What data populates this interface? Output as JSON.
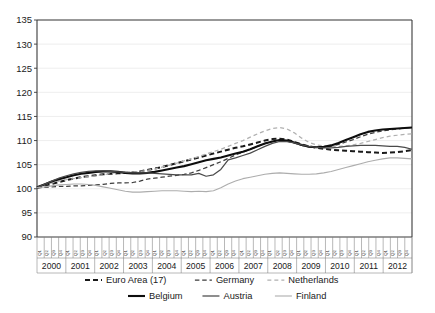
{
  "chart_data": {
    "type": "line",
    "title": "",
    "xlabel": "",
    "ylabel": "",
    "ylim": [
      90,
      135
    ],
    "ytick_step": 5,
    "yticks": [
      "90",
      "95",
      "100",
      "105",
      "110",
      "115",
      "120",
      "125",
      "130",
      "135"
    ],
    "grid": true,
    "legend_position": "bottom",
    "x_years": [
      "2000",
      "2001",
      "2002",
      "2003",
      "2004",
      "2005",
      "2006",
      "2007",
      "2008",
      "2009",
      "2010",
      "2011",
      "2012"
    ],
    "x_quarters": [
      "Q1",
      "Q2",
      "Q3",
      "Q4"
    ],
    "x": [
      "2000Q1",
      "2000Q2",
      "2000Q3",
      "2000Q4",
      "2001Q1",
      "2001Q2",
      "2001Q3",
      "2001Q4",
      "2002Q1",
      "2002Q2",
      "2002Q3",
      "2002Q4",
      "2003Q1",
      "2003Q2",
      "2003Q3",
      "2003Q4",
      "2004Q1",
      "2004Q2",
      "2004Q3",
      "2004Q4",
      "2005Q1",
      "2005Q2",
      "2005Q3",
      "2005Q4",
      "2006Q1",
      "2006Q2",
      "2006Q3",
      "2006Q4",
      "2007Q1",
      "2007Q2",
      "2007Q3",
      "2007Q4",
      "2008Q1",
      "2008Q2",
      "2008Q3",
      "2008Q4",
      "2009Q1",
      "2009Q2",
      "2009Q3",
      "2009Q4",
      "2010Q1",
      "2010Q2",
      "2010Q3",
      "2010Q4",
      "2011Q1",
      "2011Q2",
      "2011Q3",
      "2011Q4",
      "2012Q1",
      "2012Q2",
      "2012Q3",
      "2012Q4"
    ],
    "series": [
      {
        "name": "Euro Area (17)",
        "style": "dashed",
        "color": "#1a1a1a",
        "width": 2.0,
        "dash": "5,3",
        "values": [
          100.2,
          100.6,
          101.0,
          101.4,
          101.8,
          102.1,
          102.4,
          102.6,
          102.8,
          103.0,
          103.1,
          103.2,
          103.3,
          103.4,
          103.6,
          103.9,
          104.2,
          104.5,
          104.9,
          105.3,
          105.7,
          106.1,
          106.5,
          106.9,
          107.3,
          107.7,
          108.1,
          108.5,
          108.8,
          109.2,
          109.6,
          110.0,
          110.3,
          110.4,
          110.2,
          109.7,
          109.2,
          108.8,
          108.5,
          108.3,
          108.1,
          108.0,
          107.9,
          107.8,
          107.7,
          107.6,
          107.5,
          107.4,
          107.5,
          107.6,
          107.8,
          108.0
        ]
      },
      {
        "name": "Germany",
        "style": "dashed",
        "color": "#3d3d3d",
        "width": 1.25,
        "dash": "4.5,2.8",
        "values": [
          100.2,
          100.3,
          100.4,
          100.5,
          100.5,
          100.6,
          100.6,
          100.7,
          100.8,
          100.9,
          101.1,
          101.2,
          101.2,
          101.3,
          101.6,
          102.0,
          102.2,
          102.4,
          102.6,
          102.8,
          103.0,
          103.3,
          103.8,
          104.4,
          105.0,
          105.6,
          106.3,
          107.0,
          107.6,
          108.2,
          108.8,
          109.4,
          109.8,
          110.0,
          109.9,
          109.5,
          109.0,
          108.7,
          108.6,
          108.6,
          108.8,
          109.2,
          109.7,
          110.2,
          110.8,
          111.3,
          111.7,
          112.0,
          112.2,
          112.4,
          112.6,
          112.7
        ]
      },
      {
        "name": "Netherlands",
        "style": "dashed",
        "color": "#b0b0b0",
        "width": 1.25,
        "dash": "4,3",
        "values": [
          100.3,
          100.8,
          101.2,
          101.6,
          101.9,
          102.1,
          102.3,
          102.5,
          102.7,
          102.9,
          103.2,
          103.4,
          103.5,
          103.5,
          103.6,
          103.8,
          104.1,
          104.5,
          104.9,
          105.3,
          105.8,
          106.2,
          106.7,
          107.2,
          107.7,
          108.2,
          108.8,
          109.4,
          110.0,
          110.7,
          111.4,
          112.0,
          112.5,
          112.7,
          112.4,
          111.6,
          110.5,
          109.6,
          109.1,
          108.9,
          108.8,
          108.8,
          108.9,
          109.1,
          109.4,
          109.8,
          110.2,
          110.6,
          110.9,
          111.1,
          111.3,
          111.4
        ]
      },
      {
        "name": "Belgium",
        "style": "solid",
        "color": "#0d0d0d",
        "width": 2.1,
        "dash": "none",
        "values": [
          100.3,
          100.9,
          101.5,
          102.0,
          102.4,
          102.8,
          103.1,
          103.3,
          103.5,
          103.6,
          103.6,
          103.5,
          103.3,
          103.2,
          103.2,
          103.3,
          103.5,
          103.8,
          104.1,
          104.4,
          104.7,
          105.1,
          105.5,
          105.9,
          106.2,
          106.5,
          106.9,
          107.3,
          107.7,
          108.2,
          108.8,
          109.4,
          109.8,
          110.1,
          110.0,
          109.6,
          109.1,
          108.7,
          108.6,
          108.7,
          109.0,
          109.5,
          110.1,
          110.7,
          111.3,
          111.8,
          112.1,
          112.3,
          112.4,
          112.5,
          112.6,
          112.7
        ]
      },
      {
        "name": "Austria",
        "style": "solid",
        "color": "#4a4a4a",
        "width": 1.25,
        "dash": "none",
        "values": [
          100.3,
          100.9,
          101.6,
          102.2,
          102.7,
          103.1,
          103.4,
          103.6,
          103.7,
          103.7,
          103.6,
          103.5,
          103.4,
          103.3,
          103.3,
          103.3,
          103.2,
          103.1,
          103.0,
          102.9,
          102.9,
          102.9,
          103.2,
          102.6,
          102.9,
          104.0,
          106.0,
          106.4,
          106.9,
          107.4,
          108.1,
          108.8,
          109.4,
          109.8,
          109.8,
          109.5,
          109.1,
          108.8,
          108.6,
          108.5,
          108.5,
          108.6,
          108.8,
          108.9,
          109.0,
          109.0,
          109.0,
          108.9,
          108.8,
          108.8,
          108.6,
          108.2
        ]
      },
      {
        "name": "Finland",
        "style": "solid",
        "color": "#adadad",
        "width": 1.1,
        "dash": "none",
        "values": [
          100.2,
          100.4,
          100.6,
          100.8,
          100.9,
          101.0,
          101.0,
          100.9,
          100.7,
          100.4,
          100.1,
          99.8,
          99.5,
          99.3,
          99.3,
          99.4,
          99.5,
          99.6,
          99.6,
          99.6,
          99.5,
          99.4,
          99.5,
          99.4,
          99.6,
          100.2,
          101.0,
          101.6,
          102.1,
          102.4,
          102.7,
          103.0,
          103.2,
          103.3,
          103.2,
          103.1,
          103.0,
          103.0,
          103.1,
          103.3,
          103.6,
          104.0,
          104.4,
          104.8,
          105.2,
          105.6,
          105.9,
          106.2,
          106.4,
          106.4,
          106.3,
          106.2
        ]
      }
    ]
  },
  "legend": {
    "row1": [
      {
        "label": "Euro Area (17)",
        "swatch": "dashed-heavy-black"
      },
      {
        "label": "Germany",
        "swatch": "dashed-dark"
      },
      {
        "label": "Netherlands",
        "swatch": "dashed-light"
      }
    ],
    "row2": [
      {
        "label": "Belgium",
        "swatch": "solid-heavy-black"
      },
      {
        "label": "Austria",
        "swatch": "solid-dark"
      },
      {
        "label": "Finland",
        "swatch": "solid-light"
      }
    ]
  }
}
